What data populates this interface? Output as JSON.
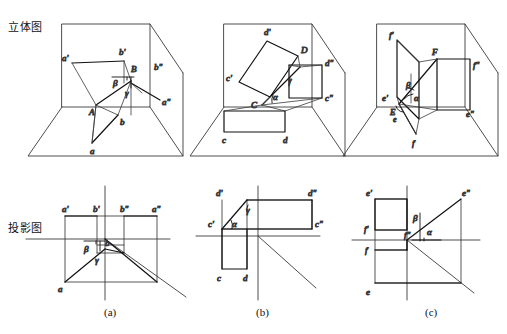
{
  "figure": {
    "width": 507,
    "height": 334,
    "background": "#ffffff",
    "line_color": "#3a3a3a",
    "heavy_line_color": "#111111",
    "text_color": "#111111"
  },
  "row_labels": {
    "solid": "立体图",
    "projection": "投影图"
  },
  "captions": {
    "a": "(a)",
    "b": "(b)",
    "c": "(c)"
  },
  "panels": [
    {
      "id": "a",
      "caption": "(a)",
      "solid_labels": [
        "a'",
        "b'",
        "b\"",
        "a\"",
        "A",
        "B",
        "b",
        "a",
        "β",
        "γ"
      ],
      "projection_labels": [
        "a'",
        "b'",
        "b\"",
        "a\"",
        "b",
        "a",
        "β",
        "γ"
      ],
      "angles": [
        "β",
        "γ"
      ]
    },
    {
      "id": "b",
      "caption": "(b)",
      "solid_labels": [
        "d'",
        "D",
        "d\"",
        "c'",
        "C",
        "c\"",
        "c",
        "d",
        "α",
        "γ"
      ],
      "projection_labels": [
        "d'",
        "d\"",
        "c'",
        "c\"",
        "c",
        "d",
        "α",
        "γ"
      ],
      "angles": [
        "α",
        "γ"
      ]
    },
    {
      "id": "c",
      "caption": "(c)",
      "solid_labels": [
        "f'",
        "F",
        "f\"",
        "e'",
        "E",
        "e",
        "e\"",
        "f",
        "α",
        "β"
      ],
      "projection_labels": [
        "e'",
        "e\"",
        "f'",
        "f\"",
        "f",
        "e",
        "α",
        "β"
      ],
      "angles": [
        "α",
        "β"
      ]
    }
  ],
  "labels_a_solid": {
    "a_prime": "a'",
    "b_prime": "b'",
    "b_dprime": "b\"",
    "a_dprime": "a\"",
    "A": "A",
    "B": "B",
    "b": "b",
    "a": "a",
    "beta": "β",
    "gamma": "γ"
  },
  "labels_b_solid": {
    "d_prime": "d'",
    "D": "D",
    "d_dprime": "d\"",
    "c_prime": "c'",
    "C": "C",
    "c_dprime": "c\"",
    "c": "c",
    "d": "d",
    "alpha": "α",
    "gamma": "γ"
  },
  "labels_c_solid": {
    "f_prime": "f'",
    "F": "F",
    "f_dprime": "f\"",
    "e_prime": "e'",
    "E": "E",
    "e_low": "e",
    "e_dprime": "e\"",
    "f": "f",
    "alpha": "α",
    "beta": "β"
  },
  "labels_a_proj": {
    "a_prime": "a'",
    "b_prime": "b'",
    "b_dprime": "b\"",
    "a_dprime": "a\"",
    "b": "b",
    "a": "a",
    "beta": "β",
    "gamma": "γ"
  },
  "labels_b_proj": {
    "d_prime": "d'",
    "d_dprime": "d\"",
    "c_prime": "c'",
    "c_dprime": "c\"",
    "c": "c",
    "d": "d",
    "alpha": "α",
    "gamma": "γ"
  },
  "labels_c_proj": {
    "e_prime": "e'",
    "e_dprime": "e\"",
    "f_prime": "f'",
    "f_dprime": "f\"",
    "f": "f",
    "e": "e",
    "alpha": "α",
    "beta": "β"
  }
}
